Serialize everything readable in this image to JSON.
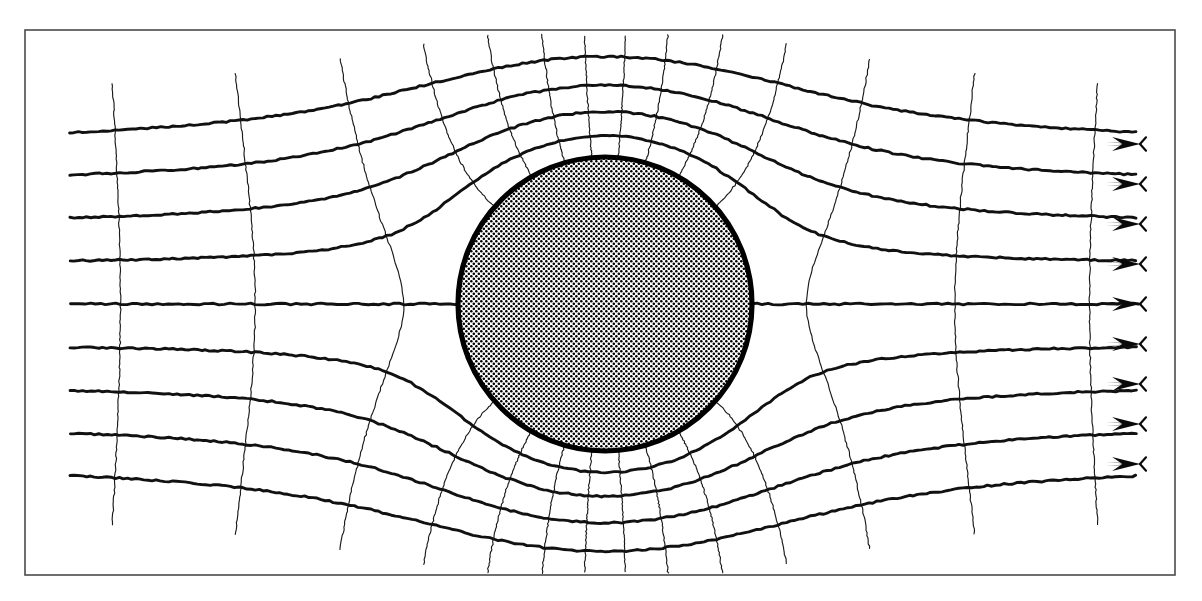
{
  "figure": {
    "kind": "flow-net-diagram",
    "caption": "",
    "background_color": "#ffffff",
    "frame": {
      "x": 25,
      "y": 30,
      "width": 1150,
      "height": 545,
      "stroke_color": "#4a4a4a",
      "stroke_width": 1.6
    }
  },
  "cylinder": {
    "label": "circular-cylinder",
    "center_x": 605,
    "center_y": 304,
    "radius": 147,
    "outline_color": "#000000",
    "outline_width": 5.2,
    "fill_style": "stipple-dot-screen",
    "fill_dot_color": "#000000",
    "fill_background": "#ffffff",
    "dot_pitch": 5.0,
    "dot_radius": 1.25
  },
  "flow": {
    "direction": "left-to-right",
    "free_stream_label": "uniform approach flow",
    "domain_x_start": 70,
    "domain_x_end": 1140,
    "streamline_color": "#111111",
    "streamline_width": 2.9,
    "equipotential_color": "#1a1a1a",
    "equipotential_width": 1.15
  },
  "chart_data": {
    "type": "line",
    "xlabel": "",
    "ylabel": "",
    "xlim": [
      70,
      1140
    ],
    "ylim": [
      30,
      575
    ],
    "grid": false,
    "legend": "none",
    "model": "uniform-stream-plus-doublet",
    "cylinder_radius_px": 147,
    "cylinder_center_px": [
      605,
      304
    ],
    "scale_px_per_unit": 147,
    "streamline_psi_values": [
      -4,
      -3,
      -2,
      -1,
      0,
      1,
      2,
      3,
      4
    ],
    "streamline_far_field_y_px": [
      464,
      424,
      384,
      344,
      304,
      264,
      224,
      184,
      144
    ],
    "streamline_count": 9,
    "equipotential_phi_values": [
      -7.4,
      -6.45,
      -5.5,
      -4.55,
      -3.6,
      -2.8,
      -2.1,
      -1.5,
      -1.0,
      -0.55,
      -0.18,
      0.18,
      0.55,
      1.0,
      1.5,
      2.1,
      2.8,
      3.6,
      4.55,
      5.5,
      6.45,
      7.4
    ],
    "equipotential_count": 22,
    "arrow_count": 9,
    "arrow_x_px": 1140,
    "arrow_y_px": [
      144,
      184,
      224,
      264,
      304,
      344,
      384,
      424,
      464
    ],
    "annotations": [
      {
        "name": "upstream-stagnation-point",
        "x": 458,
        "y": 304
      },
      {
        "name": "downstream-stagnation-point",
        "x": 752,
        "y": 304
      },
      {
        "name": "dividing-streamline",
        "psi": 0
      }
    ]
  },
  "arrows": {
    "name": "flow-direction-arrow",
    "count": 9,
    "color": "#0a0a0a",
    "length": 34,
    "half_width": 7
  }
}
